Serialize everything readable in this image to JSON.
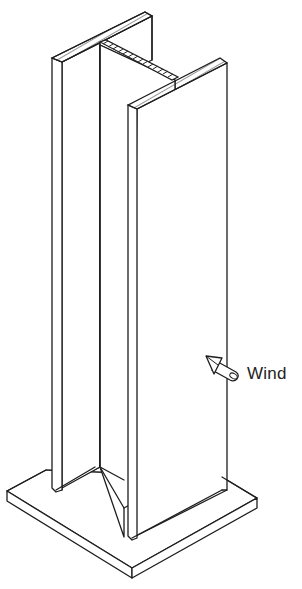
{
  "figure": {
    "labels": {
      "wind": "Wind"
    },
    "components": [
      {
        "name": "base-plate",
        "description": "rectangular steel base plate"
      },
      {
        "name": "back-flange",
        "description": "rear flange of I-section column"
      },
      {
        "name": "web",
        "description": "web of I-section, hatched top section"
      },
      {
        "name": "front-flange",
        "description": "front flange of I-section column"
      },
      {
        "name": "wind-arrow",
        "description": "arrow indicating wind pressure acting on front flange"
      }
    ],
    "colors": {
      "line": "#1e1e1e",
      "background": "#ffffff"
    }
  }
}
